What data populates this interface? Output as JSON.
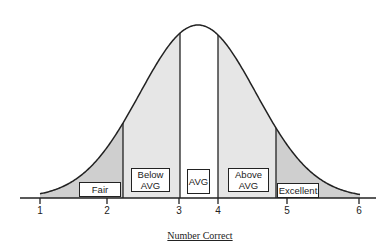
{
  "diagram": {
    "type": "normal-distribution-bands",
    "x_axis_label": "Number Correct",
    "ticks": [
      {
        "label": "1",
        "x": 40
      },
      {
        "label": "2",
        "x": 107
      },
      {
        "label": "3",
        "x": 179
      },
      {
        "label": "4",
        "x": 218
      },
      {
        "label": "5",
        "x": 287
      },
      {
        "label": "6",
        "x": 359
      }
    ],
    "bands": [
      {
        "label": "Fair",
        "fill": "#cfcfcf"
      },
      {
        "label": "Below AVG",
        "line1": "Below",
        "line2": "AVG",
        "fill": "#e6e6e6"
      },
      {
        "label": "AVG",
        "fill": "#ffffff"
      },
      {
        "label": "Above AVG",
        "line1": "Above",
        "line2": "AVG",
        "fill": "#e6e6e6"
      },
      {
        "label": "Excellent",
        "fill": "#cfcfcf"
      }
    ],
    "dividers_x": [
      123,
      180,
      218,
      276
    ],
    "colors": {
      "line": "#222222",
      "dark_band": "#cfcfcf",
      "light_band": "#e6e6e6"
    }
  }
}
